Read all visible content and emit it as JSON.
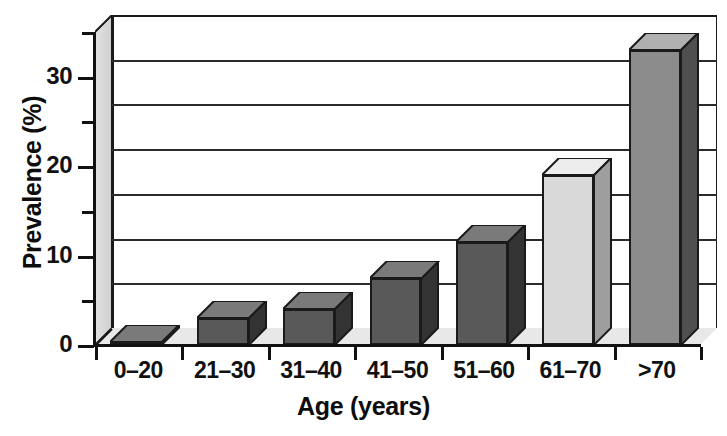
{
  "chart_data": {
    "type": "bar",
    "title": "",
    "xlabel": "Age (years)",
    "ylabel": "Prevalence (%)",
    "categories": [
      "0–20",
      "21–30",
      "31–40",
      "41–50",
      "51–60",
      "61–70",
      ">70"
    ],
    "values": [
      0.3,
      3.0,
      4.0,
      7.5,
      11.5,
      19.0,
      33.0
    ],
    "ylim": [
      0,
      35
    ],
    "ytick_values": [
      0,
      5,
      10,
      15,
      20,
      25,
      30,
      35
    ],
    "ytick_labels": [
      "0",
      "",
      "10",
      "",
      "20",
      "",
      "30",
      ""
    ],
    "gridlines": [
      5,
      10,
      15,
      20,
      25,
      30
    ],
    "grid": true,
    "legend": "none",
    "style": "3d-column",
    "bar_colors": [
      "#595959",
      "#595959",
      "#595959",
      "#595959",
      "#595959",
      "#d9d9d9",
      "#8c8c8c"
    ],
    "bar_top_colors": [
      "#7a7a7a",
      "#7a7a7a",
      "#7a7a7a",
      "#7a7a7a",
      "#7a7a7a",
      "#ededed",
      "#b0b0b0"
    ],
    "bar_side_colors": [
      "#333333",
      "#333333",
      "#333333",
      "#333333",
      "#333333",
      "#9e9e9e",
      "#4f4f4f"
    ]
  },
  "axes": {
    "y_title": "Prevalence (%)",
    "x_title": "Age (years)"
  },
  "colors": {
    "axis": "#111111",
    "grid": "#2b2b2b",
    "floor": "#e8e8e8",
    "wall": "#d8d8d8",
    "background": "#ffffff"
  }
}
